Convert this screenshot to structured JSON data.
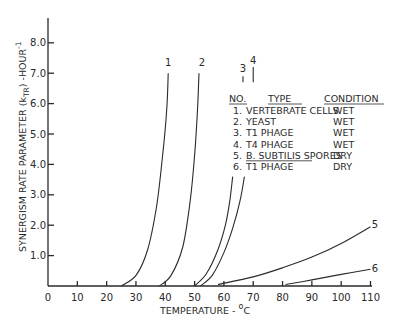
{
  "chart_data": {
    "type": "line",
    "title": "",
    "xlabel": "TEMPERATURE - °C",
    "ylabel": "SYNERGISM RATE PARAMETER (k_TR) -HOUR^-1",
    "xlim": [
      0,
      110
    ],
    "ylim": [
      0,
      8.8
    ],
    "x_ticks": [
      0,
      10,
      20,
      30,
      40,
      50,
      60,
      70,
      80,
      90,
      100,
      110
    ],
    "x_tick_labels": [
      "0",
      "10",
      "20",
      "30",
      "40",
      "50",
      "60",
      "70",
      "80",
      "90",
      "100",
      "110"
    ],
    "y_ticks": [
      1,
      2,
      3,
      4,
      5,
      6,
      7,
      8
    ],
    "y_tick_labels": [
      "1.0",
      "2.0",
      "3.0",
      "4.0",
      "5.0",
      "6.0",
      "7.0",
      "8.0"
    ],
    "grid": false,
    "series": [
      {
        "name": "1",
        "x": [
          25,
          30,
          34,
          37,
          39,
          40.5,
          41
        ],
        "y": [
          0,
          0.35,
          1.2,
          2.6,
          4.2,
          5.8,
          7.0
        ]
      },
      {
        "name": "2",
        "x": [
          38,
          42,
          46,
          48.5,
          50,
          51,
          51.5
        ],
        "y": [
          0,
          0.35,
          1.3,
          2.8,
          4.3,
          5.8,
          7.0
        ]
      },
      {
        "name": "3",
        "x": [
          50,
          54,
          58,
          60.5,
          62,
          63
        ],
        "y": [
          0,
          0.4,
          1.2,
          2.0,
          2.8,
          3.6
        ]
      },
      {
        "name": "4",
        "x": [
          52,
          56,
          60,
          63,
          65.5,
          67
        ],
        "y": [
          0,
          0.35,
          1.1,
          1.9,
          2.8,
          3.6
        ]
      },
      {
        "name": "5",
        "x": [
          58,
          70,
          80,
          90,
          100,
          110
        ],
        "y": [
          0.05,
          0.3,
          0.6,
          0.95,
          1.4,
          1.95
        ]
      },
      {
        "name": "6",
        "x": [
          81,
          90,
          100,
          110
        ],
        "y": [
          0.05,
          0.2,
          0.38,
          0.55
        ]
      }
    ],
    "curve_labels": [
      {
        "text": "1",
        "x": 41,
        "y": 7.35
      },
      {
        "text": "2",
        "x": 52.5,
        "y": 7.35
      },
      {
        "text": "3",
        "x": 66.5,
        "y": 7.15
      },
      {
        "text": "4",
        "x": 70,
        "y": 7.4
      },
      {
        "text": "5",
        "x": 111.5,
        "y": 2.0
      },
      {
        "text": "6",
        "x": 111.5,
        "y": 0.55
      }
    ],
    "legend": {
      "placement": "top-right",
      "headers": [
        "NO.",
        "TYPE",
        "CONDITION"
      ],
      "rows": [
        {
          "no": "1.",
          "type": "VERTEBRATE CELLS",
          "condition": "WET"
        },
        {
          "no": "2.",
          "type": "YEAST",
          "condition": "WET"
        },
        {
          "no": "3.",
          "type": "T1 PHAGE",
          "condition": "WET"
        },
        {
          "no": "4.",
          "type": "T4 PHAGE",
          "condition": "WET"
        },
        {
          "no": "5.",
          "type": "B. SUBTILIS SPORES",
          "condition": "DRY"
        },
        {
          "no": "6.",
          "type": "T1 PHAGE",
          "condition": "DRY"
        }
      ]
    }
  }
}
